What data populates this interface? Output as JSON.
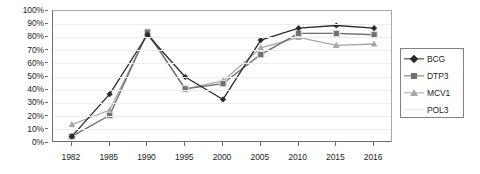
{
  "chart_data": {
    "type": "line",
    "title": "",
    "subtitle": "",
    "xlabel": "",
    "ylabel": "",
    "ylim": [
      0,
      100
    ],
    "ytick_labels": [
      "0%",
      "10%",
      "20%",
      "30%",
      "40%",
      "50%",
      "60%",
      "70%",
      "80%",
      "90%",
      "100%"
    ],
    "ytick_values": [
      0,
      10,
      20,
      30,
      40,
      50,
      60,
      70,
      80,
      90,
      100
    ],
    "grid": true,
    "grid_axis": "y",
    "legend_position": "right",
    "categories": [
      "1982",
      "1985",
      "1990",
      "1995",
      "2000",
      "2005",
      "2010",
      "2015",
      "2016"
    ],
    "series": [
      {
        "name": "BCG",
        "color": "#2b2b2b",
        "marker": "diamond",
        "values": [
          5,
          37,
          82,
          50,
          33,
          78,
          87,
          89,
          87
        ]
      },
      {
        "name": "DTP3",
        "color": "#6e7072",
        "marker": "square",
        "values": [
          5,
          21,
          84,
          41,
          45,
          67,
          83,
          83,
          82
        ]
      },
      {
        "name": "MCV1",
        "color": "#a6a8ab",
        "marker": "triangle",
        "values": [
          14,
          25,
          83,
          41,
          47,
          72,
          80,
          74,
          75
        ]
      },
      {
        "name": "POL3",
        "color": "#e2e3e4",
        "marker": "none",
        "values": [
          5,
          21,
          83,
          41,
          45,
          68,
          83,
          83,
          82
        ]
      }
    ]
  },
  "legend": {
    "items": [
      {
        "label": "BCG"
      },
      {
        "label": "DTP3"
      },
      {
        "label": "MCV1"
      },
      {
        "label": "POL3"
      }
    ]
  }
}
